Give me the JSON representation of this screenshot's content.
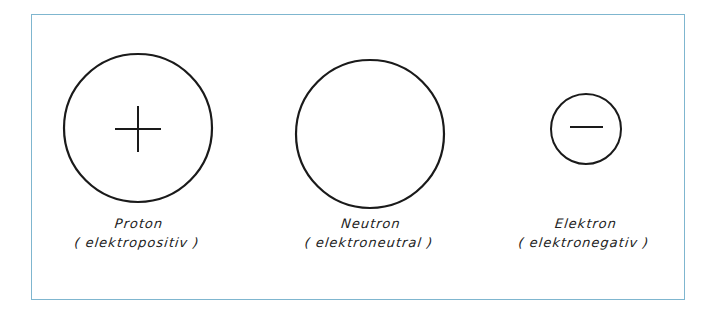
{
  "particles": [
    {
      "name": "Proton",
      "charge": "( elektropositiv )",
      "symbol": "plus",
      "cx": 138,
      "cy": 128,
      "r": 74
    },
    {
      "name": "Neutron",
      "charge": "( elektroneutral )",
      "symbol": "none",
      "cx": 370,
      "cy": 134,
      "r": 74
    },
    {
      "name": "Elektron",
      "charge": "( elektronegativ )",
      "symbol": "minus",
      "cx": 586,
      "cy": 129,
      "r": 35
    }
  ],
  "colors": {
    "border": "#7fb6cf",
    "stroke": "#1a1a1a"
  }
}
